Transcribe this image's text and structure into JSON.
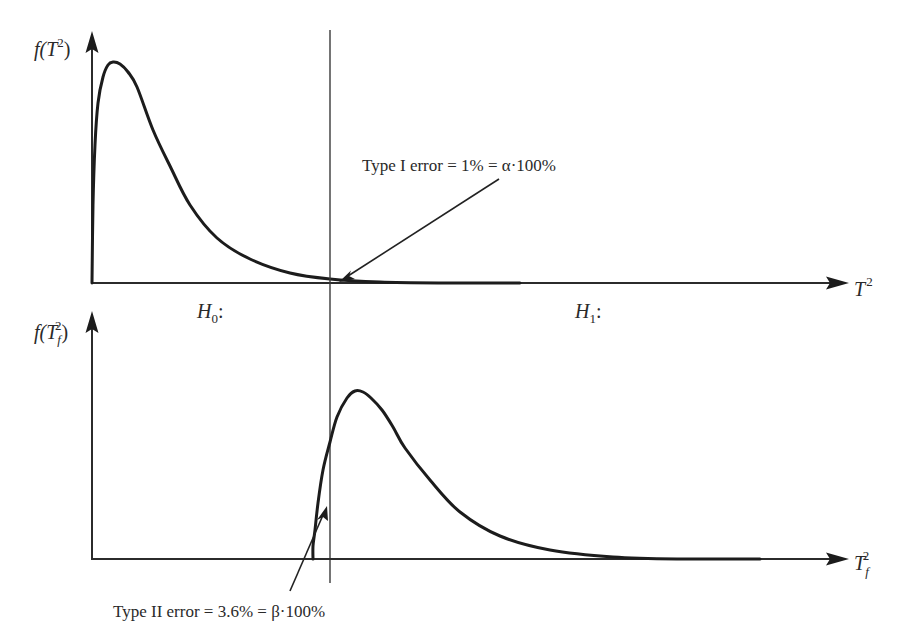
{
  "chart_data": [
    {
      "type": "line",
      "title": "",
      "panel": "top",
      "ylabel": "f(T²)",
      "xlabel": "T²",
      "grid": false,
      "series": [
        {
          "name": "H0 distribution f(T²)",
          "points_px": [
            [
              92,
              283
            ],
            [
              93,
              205
            ],
            [
              95,
              145
            ],
            [
              98,
              103
            ],
            [
              103,
              77
            ],
            [
              108,
              65
            ],
            [
              113,
              62
            ],
            [
              120,
              64
            ],
            [
              128,
              72
            ],
            [
              137,
              87
            ],
            [
              153,
              130
            ],
            [
              170,
              166
            ],
            [
              190,
              205
            ],
            [
              217,
              238
            ],
            [
              250,
              259
            ],
            [
              290,
              273
            ],
            [
              330,
              279
            ],
            [
              380,
              282
            ],
            [
              450,
              283
            ],
            [
              520,
              283
            ]
          ]
        }
      ],
      "annotations": [
        {
          "text": "Type I error = 1% = α·100%",
          "points_to": "tail of H0 curve right of critical line"
        },
        {
          "text": "H0:",
          "region": "left of critical value"
        },
        {
          "text": "H1:",
          "region": "right of critical value"
        }
      ],
      "critical_value_line": "vertical line separating H0 and H1 regions"
    },
    {
      "type": "line",
      "title": "",
      "panel": "bottom",
      "ylabel": "f(Tf²)",
      "xlabel": "Tf²",
      "grid": false,
      "series": [
        {
          "name": "Faulty distribution f(Tf²)",
          "points_px": [
            [
              313,
              559
            ],
            [
              313,
              546
            ],
            [
              315,
              530
            ],
            [
              318,
              503
            ],
            [
              323,
              470
            ],
            [
              330,
              442
            ],
            [
              337,
              417
            ],
            [
              347,
              398
            ],
            [
              355,
              391
            ],
            [
              363,
              392
            ],
            [
              371,
              398
            ],
            [
              382,
              410
            ],
            [
              393,
              427
            ],
            [
              405,
              448
            ],
            [
              430,
              480
            ],
            [
              460,
              512
            ],
            [
              500,
              536
            ],
            [
              550,
              550
            ],
            [
              613,
              557
            ],
            [
              680,
              559
            ],
            [
              760,
              559
            ]
          ]
        }
      ],
      "annotations": [
        {
          "text": "Type II error = 3.6% = β·100%",
          "points_to": "area of faulty curve left of critical line"
        }
      ]
    }
  ],
  "figure": {
    "top_panel": {
      "ylabel": {
        "base": "f(",
        "var": "T",
        "sup": "2",
        "close": ")"
      },
      "xlabel": {
        "var": "T",
        "sup": "2"
      }
    },
    "bottom_panel": {
      "ylabel": {
        "base": "f(",
        "var": "T",
        "sub": "f",
        "sup": "2",
        "close": ")"
      },
      "xlabel": {
        "var": "T",
        "sub": "f",
        "sup": "2"
      }
    },
    "regions": {
      "h0": {
        "var": "H",
        "sub": "0",
        "colon": ":"
      },
      "h1": {
        "var": "H",
        "sub": "1",
        "colon": ":"
      }
    },
    "type1_note": "Type I error = 1% = α·100%",
    "type2_note": "Type II error = 3.6% = β·100%",
    "colors": {
      "ink": "#1c1c1c",
      "background": "#ffffff"
    }
  }
}
